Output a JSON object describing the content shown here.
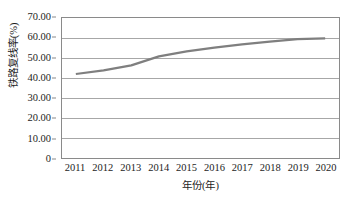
{
  "chart_data": {
    "type": "line",
    "title": "",
    "subtitle": "",
    "xlabel": "年份(年)",
    "ylabel": "铁路复线率(%)",
    "categories": [
      "2011",
      "2012",
      "2013",
      "2014",
      "2015",
      "2016",
      "2017",
      "2018",
      "2019",
      "2020"
    ],
    "x": [
      2011,
      2012,
      2013,
      2014,
      2015,
      2016,
      2017,
      2018,
      2019,
      2020
    ],
    "values": [
      42.0,
      43.8,
      46.3,
      50.8,
      53.3,
      55.2,
      56.8,
      58.2,
      59.4,
      59.8
    ],
    "series": [
      {
        "name": "铁路复线率",
        "values": [
          42.0,
          43.8,
          46.3,
          50.8,
          53.3,
          55.2,
          56.8,
          58.2,
          59.4,
          59.8
        ],
        "color": "#7f7f7f"
      }
    ],
    "ylim": [
      0,
      70
    ],
    "xlim": [
      2011,
      2020
    ],
    "y_ticks": [
      0,
      10,
      20,
      30,
      40,
      50,
      60,
      70
    ],
    "y_tick_labels": [
      "0",
      "10.00",
      "20.00",
      "30.00",
      "40.00",
      "50.00",
      "60.00",
      "70.00"
    ],
    "x_tick_labels": [
      "2011",
      "2012",
      "2013",
      "2014",
      "2015",
      "2016",
      "2017",
      "2018",
      "2019",
      "2020"
    ],
    "grid": true,
    "grid_axis": "y",
    "legend": false,
    "legend_position": "none",
    "markers": false,
    "plot_border": true,
    "annotations": []
  },
  "colors": {
    "series_line": "#7f7f7f",
    "gridline": "#a6a6a6",
    "axis_border": "#8a8a8a",
    "text": "#1d1d1d",
    "background": "#ffffff"
  }
}
